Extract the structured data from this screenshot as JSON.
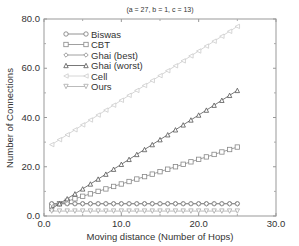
{
  "chart_data": {
    "type": "line",
    "title": "",
    "subtitle": "(a = 27, b = 1, c = 13)",
    "xlabel": "Moving distance (Number of Hops)",
    "ylabel": "Number of Connections",
    "xlim": [
      0,
      30
    ],
    "ylim": [
      0,
      80
    ],
    "x_ticks": [
      "0.0",
      "10.0",
      "20.0",
      "30.0"
    ],
    "y_ticks": [
      "0.0",
      "20.0",
      "40.0",
      "60.0",
      "80.0"
    ],
    "grid": false,
    "legend_position": "upper-left",
    "x": [
      1,
      2,
      3,
      4,
      5,
      6,
      7,
      8,
      9,
      10,
      11,
      12,
      13,
      14,
      15,
      16,
      17,
      18,
      19,
      20,
      21,
      22,
      23,
      24,
      25
    ],
    "series": [
      {
        "name": "Biswas",
        "marker": "circle",
        "color": "#777777",
        "values": [
          5,
          5,
          5,
          5,
          5,
          5,
          5,
          5,
          5,
          5,
          5,
          5,
          5,
          5,
          5,
          5,
          5,
          5,
          5,
          5,
          5,
          5,
          5,
          5,
          5
        ]
      },
      {
        "name": "CBT",
        "marker": "square",
        "color": "#888888",
        "values": [
          4,
          5,
          6,
          7,
          8,
          9,
          10,
          11,
          12,
          13,
          14,
          15,
          16,
          17,
          18,
          19,
          20,
          21,
          22,
          23,
          24,
          25,
          26,
          27,
          28
        ]
      },
      {
        "name": "Ghai (best)",
        "marker": "diamond",
        "color": "#888888",
        "values": [
          5,
          5,
          5,
          5,
          5,
          5,
          5,
          5,
          5,
          5,
          5,
          5,
          5,
          5,
          5,
          5,
          5,
          5,
          5,
          5,
          5,
          5,
          5,
          5,
          5
        ]
      },
      {
        "name": "Ghai (worst)",
        "marker": "triangle-up",
        "color": "#555555",
        "values": [
          3,
          5,
          7,
          9,
          11,
          13,
          15,
          17,
          19,
          21,
          23,
          25,
          27,
          29,
          31,
          33,
          35,
          37,
          39,
          41,
          43,
          45,
          47,
          49,
          51
        ]
      },
      {
        "name": "Cell",
        "marker": "triangle-left",
        "color": "#cccccc",
        "values": [
          29,
          31,
          33,
          35,
          37,
          39,
          41,
          43,
          45,
          47,
          49,
          51,
          53,
          55,
          57,
          59,
          61,
          63,
          65,
          67,
          69,
          71,
          73,
          75,
          77
        ]
      },
      {
        "name": "Ours",
        "marker": "triangle-down",
        "color": "#aaaaaa",
        "values": [
          2,
          2,
          2,
          2,
          2,
          2,
          2,
          2,
          2,
          2,
          2,
          2,
          2,
          2,
          2,
          2,
          2,
          2,
          2,
          2,
          2,
          2,
          2,
          2,
          2
        ]
      }
    ]
  }
}
